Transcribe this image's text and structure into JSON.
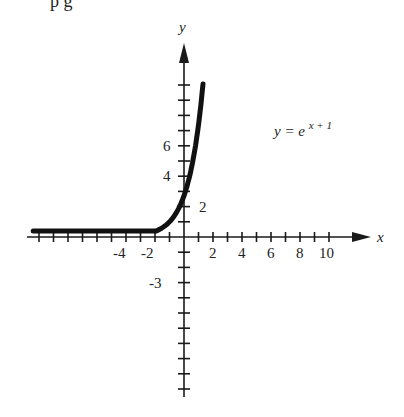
{
  "header": {
    "cut_off_text": "p         g    "
  },
  "chart_data": {
    "type": "line",
    "title": "",
    "equation_label": "y = e^(x+1)",
    "equation": {
      "base": "y = e",
      "exponent": "x + 1"
    },
    "xlabel": "x",
    "ylabel": "y",
    "x_tick_labels": [
      "-4",
      "-2",
      "2",
      "4",
      "6",
      "8",
      "10"
    ],
    "x_tick_values": [
      -4,
      -2,
      2,
      4,
      6,
      8,
      10
    ],
    "y_tick_labels": [
      "6",
      "4",
      "2",
      "-3"
    ],
    "y_tick_values": [
      6,
      4,
      2,
      -3
    ],
    "xlim": [
      -10.5,
      12.7
    ],
    "ylim": [
      -10.5,
      12.8
    ],
    "x_tick_step": 1,
    "y_tick_step": 1,
    "grid": false,
    "legend": "none",
    "series": [
      {
        "name": "y = e^(x+1)",
        "x": [
          -10.4,
          -8,
          -6,
          -5,
          -4,
          -3,
          -2.5,
          -2,
          -1.5,
          -1,
          -0.5,
          0,
          0.5,
          1,
          1.31
        ],
        "values": [
          0.0,
          0.001,
          0.007,
          0.018,
          0.05,
          0.14,
          0.22,
          0.37,
          0.61,
          1.0,
          1.65,
          2.72,
          4.48,
          7.39,
          10.1
        ]
      }
    ]
  },
  "axes": {
    "origin_px": [
      184,
      237
    ],
    "x_unit_px": 14.5,
    "y_unit_px": 15.2,
    "color": "#1a1a1a",
    "curve_color": "#111111"
  }
}
